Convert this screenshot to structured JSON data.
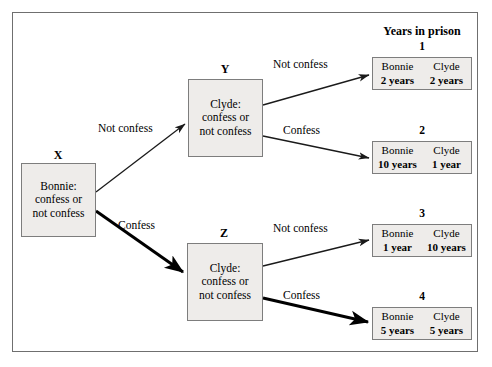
{
  "figure": {
    "title": "Years in prison",
    "type": "game-tree"
  },
  "nodes": {
    "x": {
      "label": "X",
      "line1": "Bonnie:",
      "line2": "confess or",
      "line3": "not confess"
    },
    "y": {
      "label": "Y",
      "line1": "Clyde:",
      "line2": "confess or",
      "line3": "not confess"
    },
    "z": {
      "label": "Z",
      "line1": "Clyde:",
      "line2": "confess or",
      "line3": "not confess"
    }
  },
  "edges": {
    "x_to_y": "Not confess",
    "x_to_z": "Confess",
    "y_to_o1": "Not confess",
    "y_to_o2": "Confess",
    "z_to_o3": "Not confess",
    "z_to_o4": "Confess"
  },
  "outcomes": [
    {
      "number": "1",
      "left_name": "Bonnie",
      "left_value": "2 years",
      "right_name": "Clyde",
      "right_value": "2 years"
    },
    {
      "number": "2",
      "left_name": "Bonnie",
      "left_value": "10 years",
      "right_name": "Clyde",
      "right_value": "1 year"
    },
    {
      "number": "3",
      "left_name": "Bonnie",
      "left_value": "1 year",
      "right_name": "Clyde",
      "right_value": "10 years"
    },
    {
      "number": "4",
      "left_name": "Bonnie",
      "left_value": "5 years",
      "right_name": "Clyde",
      "right_value": "5 years"
    }
  ],
  "colors": {
    "box_fill": "#eeecea",
    "box_border": "#7d7d7d",
    "frame_border": "#6f6f6f",
    "edge": "#1a1a1a",
    "background": "#ffffff"
  }
}
